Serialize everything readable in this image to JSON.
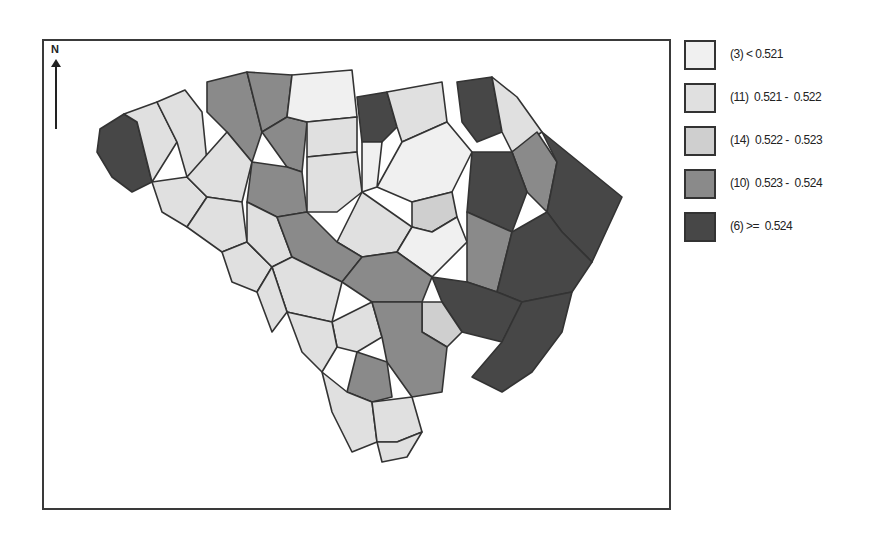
{
  "map": {
    "title": "",
    "north_arrow_label": "N",
    "region": "South Carolina counties",
    "border_color": "#333333"
  },
  "legend": {
    "items": [
      {
        "count": "(3)",
        "label": "(3) < 0.521",
        "range": "< 0.521",
        "color": "#f0f0f0"
      },
      {
        "count": "(11)",
        "label": "(11)  0.521 -  0.522",
        "range": "0.521 - 0.522",
        "color": "#e0e0e0"
      },
      {
        "count": "(14)",
        "label": "(14)  0.522 -  0.523",
        "range": "0.522 - 0.523",
        "color": "#cfcfcf"
      },
      {
        "count": "(10)",
        "label": "(10)  0.523 -  0.524",
        "range": "0.523 - 0.524",
        "color": "#8a8a8a"
      },
      {
        "count": "(6)",
        "label": "(6) >=  0.524",
        "range": ">= 0.524",
        "color": "#474747"
      }
    ]
  },
  "chart_data": {
    "type": "choropleth",
    "title": "",
    "legend_position": "right",
    "classes": [
      {
        "range": "< 0.521",
        "count": 3
      },
      {
        "range": "0.521 - 0.522",
        "count": 11
      },
      {
        "range": "0.522 - 0.523",
        "count": 14
      },
      {
        "range": "0.523 - 0.524",
        "count": 10
      },
      {
        "range": ">= 0.524",
        "count": 6
      }
    ]
  }
}
